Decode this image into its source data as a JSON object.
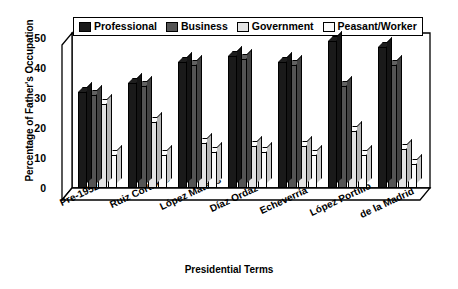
{
  "chart_data": {
    "type": "bar",
    "title": "",
    "xlabel": "Presidential Terms",
    "ylabel": "Percentage of Father's Occupation",
    "ylim": [
      0,
      50
    ],
    "yticks": [
      0,
      10,
      20,
      30,
      40,
      50
    ],
    "grid": false,
    "legend_position": "top",
    "categories": [
      "Pre-1952",
      "Ruiz Cortines",
      "López Mateos",
      "Díaz Ordaz",
      "Echeverría",
      "López Portillo",
      "de la Madrid"
    ],
    "series": [
      {
        "name": "Professional",
        "color": "#1a1a1a",
        "values": [
          32,
          35,
          42,
          44,
          42,
          49,
          47
        ]
      },
      {
        "name": "Business",
        "color": "#545454",
        "values": [
          31,
          34,
          41,
          43,
          41,
          34,
          41
        ]
      },
      {
        "name": "Government",
        "color": "#e3e3e3",
        "values": [
          28,
          22,
          15,
          14,
          14,
          19,
          13
        ]
      },
      {
        "name": "Peasant/Worker",
        "color": "#fbfbfb",
        "values": [
          11,
          11,
          12,
          12,
          11,
          11,
          8
        ]
      }
    ]
  },
  "legend": {
    "items": [
      {
        "label": "Professional"
      },
      {
        "label": "Business"
      },
      {
        "label": "Government"
      },
      {
        "label": "Peasant/Worker"
      }
    ]
  },
  "axes": {
    "y_title": "Percentage of Father's Occupation",
    "x_title": "Presidential Terms"
  }
}
